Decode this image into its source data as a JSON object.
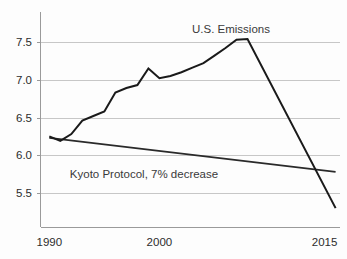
{
  "chart_data": {
    "type": "line",
    "title": "",
    "subtitle": "",
    "xlabel": "",
    "ylabel": "",
    "xlim": [
      1989.2,
      2016.4
    ],
    "ylim": [
      5.2,
      7.7
    ],
    "grid": true,
    "grid_axis": "y",
    "legend_position": "inline-annotation",
    "y_ticks": [
      "7.5",
      "7.0",
      "6.5",
      "6.0",
      "5.5"
    ],
    "y_tick_values": [
      7.5,
      7.0,
      6.5,
      6.0,
      5.5
    ],
    "x_ticks": [
      "1990",
      "2000",
      "2015"
    ],
    "x_tick_values": [
      1990,
      2000,
      2015
    ],
    "annotations": [
      {
        "text": "U.S. Emissions",
        "x": 2006.5,
        "y": 7.67
      },
      {
        "text": "Kyoto Protocol, 7% decrease",
        "x": 1998.6,
        "y": 5.75
      }
    ],
    "series": [
      {
        "name": "U.S. Emissions",
        "color": "#1a1a1a",
        "x": [
          1990,
          1991,
          1992,
          1993,
          1994,
          1995,
          1996,
          1997,
          1998,
          1999,
          2000,
          2001,
          2002,
          2003,
          2004,
          2005,
          2006,
          2007,
          2008,
          2016
        ],
        "values": [
          6.25,
          6.19,
          6.28,
          6.46,
          6.52,
          6.58,
          6.83,
          6.89,
          6.93,
          7.15,
          7.02,
          7.05,
          7.1,
          7.16,
          7.22,
          7.32,
          7.42,
          7.53,
          7.54,
          5.3
        ]
      },
      {
        "name": "Kyoto Protocol, 7% decrease",
        "color": "#2a2a2a",
        "x": [
          1990,
          2016
        ],
        "values": [
          6.23,
          5.78
        ]
      }
    ]
  },
  "figure": {
    "background_color": "#fdfdfd",
    "grid_color": "#b9b9b9",
    "axis_color": "#9a9a9a",
    "text_color": "#2c2c2c"
  }
}
